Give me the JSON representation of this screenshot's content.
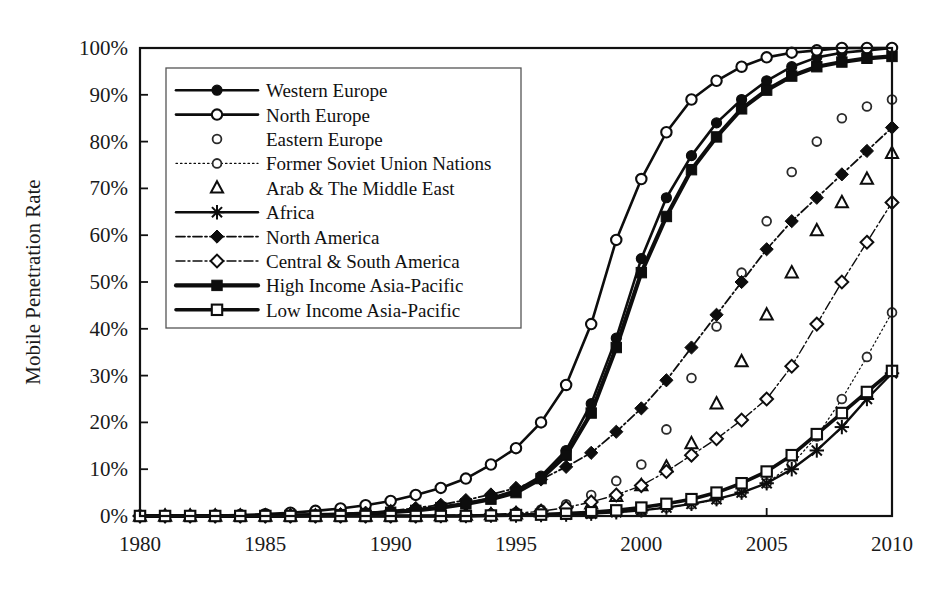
{
  "chart_data": {
    "type": "line",
    "title": "",
    "xlabel": "",
    "ylabel": "Mobile Penetration Rate",
    "xlim": [
      1980,
      2010
    ],
    "ylim": [
      0,
      1.0
    ],
    "grid": false,
    "legend_position": "upper-left",
    "x_ticks": [
      "1980",
      "1985",
      "1990",
      "1995",
      "2000",
      "2005",
      "2010"
    ],
    "x_tick_values": [
      1980,
      1985,
      1990,
      1995,
      2000,
      2005,
      2010
    ],
    "y_ticks": [
      "0%",
      "10%",
      "20%",
      "30%",
      "40%",
      "50%",
      "60%",
      "70%",
      "80%",
      "90%",
      "100%"
    ],
    "y_tick_values": [
      0,
      10,
      20,
      30,
      40,
      50,
      60,
      70,
      80,
      90,
      100
    ],
    "x": [
      1980,
      1981,
      1982,
      1983,
      1984,
      1985,
      1986,
      1987,
      1988,
      1989,
      1990,
      1991,
      1992,
      1993,
      1994,
      1995,
      1996,
      1997,
      1998,
      1999,
      2000,
      2001,
      2002,
      2003,
      2004,
      2005,
      2006,
      2007,
      2008,
      2009,
      2010
    ],
    "series": [
      {
        "name": "Western Europe",
        "marker": "filled-circle",
        "line": "solid",
        "width": 2.6,
        "values": [
          0,
          0,
          0,
          0,
          0,
          0,
          0.2,
          0.3,
          0.4,
          0.6,
          0.9,
          1.3,
          1.8,
          2.6,
          3.8,
          5.5,
          8.5,
          14,
          24,
          38,
          55,
          68,
          77,
          84,
          89,
          93,
          96,
          98,
          99,
          99.5,
          100
        ]
      },
      {
        "name": "North Europe",
        "marker": "open-circle",
        "line": "solid",
        "width": 2.6,
        "values": [
          0,
          0,
          0,
          0.1,
          0.2,
          0.4,
          0.7,
          1.1,
          1.6,
          2.3,
          3.2,
          4.5,
          6,
          8,
          11,
          14.5,
          20,
          28,
          41,
          59,
          72,
          82,
          89,
          93,
          96,
          98,
          99,
          99.5,
          100,
          100,
          100
        ]
      },
      {
        "name": "Eastern Europe",
        "marker": "open-circle-small",
        "line": "none",
        "width": 0,
        "values": [
          0,
          0,
          0,
          0,
          0,
          0,
          0,
          0,
          0,
          0,
          0,
          0.1,
          0.2,
          0.3,
          0.5,
          0.8,
          1.4,
          2.5,
          4.5,
          7.5,
          11,
          18.5,
          29.5,
          40.5,
          52,
          63,
          73.5,
          80,
          85,
          87.5,
          89
        ]
      },
      {
        "name": "Former Soviet Union Nations",
        "marker": "open-circle-small",
        "line": "dotted",
        "width": 1.2,
        "values": [
          0,
          0,
          0,
          0,
          0,
          0,
          0,
          0,
          0,
          0,
          0,
          0,
          0,
          0,
          0,
          0.1,
          0.2,
          0.3,
          0.5,
          0.8,
          1.2,
          1.8,
          2.5,
          3.5,
          5,
          7,
          11,
          17,
          25,
          34,
          43.5
        ]
      },
      {
        "name": "Arab & The Middle East",
        "marker": "open-triangle",
        "line": "none",
        "width": 0,
        "values": [
          0,
          0,
          0,
          0,
          0,
          0,
          0,
          0,
          0,
          0,
          0,
          0,
          0.1,
          0.2,
          0.3,
          0.5,
          0.9,
          1.5,
          2.6,
          4.2,
          6.5,
          10.5,
          15.5,
          24,
          33,
          43,
          52,
          61,
          67,
          72,
          77.5
        ]
      },
      {
        "name": "Africa",
        "marker": "asterisk",
        "line": "solid",
        "width": 2.4,
        "values": [
          0,
          0,
          0,
          0,
          0,
          0,
          0,
          0,
          0,
          0,
          0,
          0,
          0,
          0,
          0.1,
          0.1,
          0.2,
          0.3,
          0.5,
          0.8,
          1.2,
          1.8,
          2.6,
          3.6,
          5,
          7,
          10,
          14,
          19,
          25,
          30.5
        ]
      },
      {
        "name": "North America",
        "marker": "filled-diamond",
        "line": "dashdot",
        "width": 1.8,
        "values": [
          0,
          0,
          0,
          0,
          0,
          0,
          0.1,
          0.2,
          0.4,
          0.7,
          1.1,
          1.7,
          2.4,
          3.4,
          4.6,
          6,
          7.8,
          10.5,
          13.5,
          18,
          23,
          29,
          36,
          43,
          50,
          57,
          63,
          68,
          73,
          78,
          83
        ]
      },
      {
        "name": "Central & South America",
        "marker": "open-diamond",
        "line": "dashdot",
        "width": 1.4,
        "values": [
          0,
          0,
          0,
          0,
          0,
          0,
          0,
          0,
          0,
          0,
          0,
          0,
          0.1,
          0.2,
          0.3,
          0.6,
          1,
          1.8,
          3,
          4.5,
          6.5,
          9.5,
          13,
          16.5,
          20.5,
          25,
          32,
          41,
          50,
          58.5,
          67
        ]
      },
      {
        "name": "High Income Asia-Pacific",
        "marker": "filled-square",
        "line": "solid",
        "width": 4.2,
        "values": [
          0,
          0,
          0,
          0,
          0,
          0,
          0.1,
          0.2,
          0.3,
          0.5,
          0.8,
          1.2,
          1.8,
          2.6,
          3.6,
          5,
          8,
          13,
          22,
          36,
          52,
          64,
          74,
          81,
          87,
          91,
          94,
          96,
          97,
          97.8,
          98.2
        ]
      },
      {
        "name": "Low Income Asia-Pacific",
        "marker": "open-square",
        "line": "solid",
        "width": 3.6,
        "values": [
          0,
          0,
          0,
          0,
          0,
          0,
          0,
          0,
          0,
          0,
          0,
          0,
          0,
          0,
          0.1,
          0.2,
          0.3,
          0.5,
          0.8,
          1.2,
          1.8,
          2.6,
          3.6,
          5,
          7,
          9.5,
          13,
          17.5,
          22,
          26.5,
          31
        ]
      }
    ]
  }
}
